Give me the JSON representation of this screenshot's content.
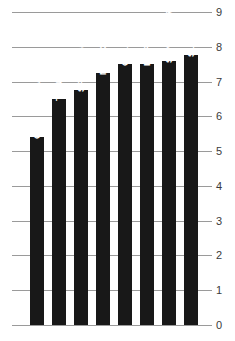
{
  "chart_data": {
    "type": "bar",
    "title": "",
    "subtitle": "",
    "xlabel": "",
    "ylabel": "",
    "categories": [
      "CIUDAD JUAREZ",
      "TIJUANA",
      "SAN DIEGO",
      "MEXICALI",
      "CALEXICO",
      "EL PASO",
      "SAN LUIS RC",
      "SLS-AZ"
    ],
    "values": [
      5.4,
      6.5,
      6.75,
      7.25,
      7.5,
      7.5,
      7.6,
      7.75
    ],
    "ylim": [
      0,
      9
    ],
    "yticks": [
      0,
      1,
      2,
      3,
      4,
      5,
      6,
      7,
      8,
      9
    ],
    "ytick_labels": [
      "0",
      "1",
      "2",
      "3",
      "4",
      "5",
      "6",
      "7",
      "8",
      "9"
    ],
    "grid": true,
    "legend": null,
    "bar_color": "#181818",
    "grid_color": "#9a9a9a",
    "label_color": "#ffffff",
    "tick_text_color": "#3a3a3a",
    "background": "#ffffff",
    "label_orientation": "vertical-inside-bar",
    "tick_label_position": "right"
  }
}
